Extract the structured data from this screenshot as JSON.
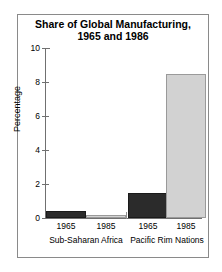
{
  "chart_data": {
    "type": "bar",
    "title": "Share of  Global Manufacturing,",
    "title_line2": "1965 and 1986",
    "xlabel": "",
    "ylabel": "Percentage",
    "ylim": [
      0,
      10
    ],
    "yticks": [
      0,
      2,
      4,
      6,
      8,
      10
    ],
    "ytick_labels": [
      "0",
      "2",
      "4",
      "6",
      "8",
      "10"
    ],
    "grid": false,
    "legend_position": "none",
    "groups": [
      {
        "name": "Sub-Saharan Africa",
        "bars": [
          {
            "year": "1965",
            "value": 0.4,
            "style": "dark"
          },
          {
            "year": "1985",
            "value": 0.2,
            "style": "light"
          }
        ]
      },
      {
        "name": "Pacific Rim Nations",
        "bars": [
          {
            "year": "1965",
            "value": 1.5,
            "style": "dark"
          },
          {
            "year": "1985",
            "value": 8.5,
            "style": "light"
          }
        ]
      }
    ],
    "categories": [
      "Sub-Saharan Africa 1965",
      "Sub-Saharan Africa 1985",
      "Pacific Rim Nations 1965",
      "Pacific Rim Nations 1985"
    ],
    "values": [
      0.4,
      0.2,
      1.5,
      8.5
    ],
    "colors": {
      "dark_bar": "#2b2b2b",
      "light_bar": "#d2d2d2",
      "axis": "#707070",
      "frame": "#8a8a8a",
      "text": "#000000",
      "background": "#ffffff"
    }
  }
}
